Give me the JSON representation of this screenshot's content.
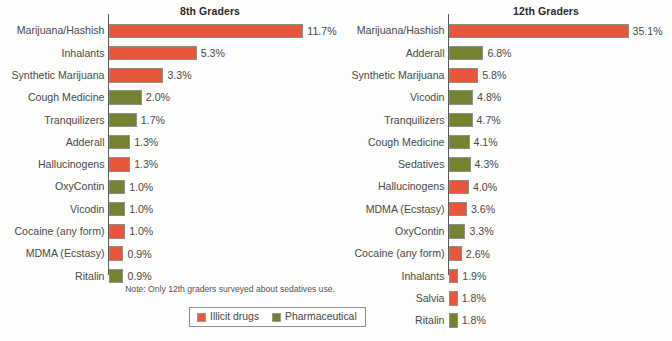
{
  "note": "Note: Only 12th graders surveyed about sedatives use.",
  "legend": {
    "items": [
      {
        "label": "Illicit drugs",
        "key": "illicit",
        "color": "#e8573c"
      },
      {
        "label": "Pharmaceutical",
        "key": "pharma",
        "color": "#74832f"
      }
    ]
  },
  "colors": {
    "illicit": "#e8573c",
    "pharmaceutical": "#74832f",
    "axis": "#59595a",
    "text": "#4a4a46",
    "background": "#fdfdfc"
  },
  "chart_data": [
    {
      "type": "bar",
      "orientation": "horizontal",
      "title": "8th Graders",
      "xlabel": "",
      "ylabel": "",
      "xlim": [
        0,
        11.7
      ],
      "grid": false,
      "value_suffix": "%",
      "categories": [
        "Marijuana/Hashish",
        "Inhalants",
        "Synthetic Marijuana",
        "Cough Medicine",
        "Tranquilizers",
        "Adderall",
        "Hallucinogens",
        "OxyContin",
        "Vicodin",
        "Cocaine (any form)",
        "MDMA (Ecstasy)",
        "Ritalin"
      ],
      "values": [
        11.7,
        5.3,
        3.3,
        2.0,
        1.7,
        1.3,
        1.3,
        1.0,
        1.0,
        1.0,
        0.9,
        0.9
      ],
      "value_labels": [
        "11.7%",
        "5.3%",
        "3.3%",
        "2.0%",
        "1.7%",
        "1.3%",
        "1.3%",
        "1.0%",
        "1.0%",
        "1.0%",
        "0.9%",
        "0.9%"
      ],
      "series_keys": [
        "illicit",
        "illicit",
        "illicit",
        "pharma",
        "pharma",
        "pharma",
        "illicit",
        "pharma",
        "pharma",
        "illicit",
        "illicit",
        "pharma"
      ]
    },
    {
      "type": "bar",
      "orientation": "horizontal",
      "title": "12th Graders",
      "xlabel": "",
      "ylabel": "",
      "xlim": [
        0,
        35.1
      ],
      "grid": false,
      "value_suffix": "%",
      "categories": [
        "Marijuana/Hashish",
        "Adderall",
        "Synthetic Marijuana",
        "Vicodin",
        "Tranquilizers",
        "Cough Medicine",
        "Sedatives",
        "Hallucinogens",
        "MDMA (Ecstasy)",
        "OxyContin",
        "Cocaine (any form)",
        "Inhalants",
        "Salvia",
        "Ritalin"
      ],
      "values": [
        35.1,
        6.8,
        5.8,
        4.8,
        4.7,
        4.1,
        4.3,
        4.0,
        3.6,
        3.3,
        2.6,
        1.9,
        1.8,
        1.8
      ],
      "value_labels": [
        "35.1%",
        "6.8%",
        "5.8%",
        "4.8%",
        "4.7%",
        "4.1%",
        "4.3%",
        "4.0%",
        "3.6%",
        "3.3%",
        "2.6%",
        "1.9%",
        "1.8%",
        "1.8%"
      ],
      "series_keys": [
        "illicit",
        "pharma",
        "illicit",
        "pharma",
        "pharma",
        "pharma",
        "pharma",
        "illicit",
        "illicit",
        "pharma",
        "illicit",
        "illicit",
        "illicit",
        "pharma"
      ]
    }
  ]
}
